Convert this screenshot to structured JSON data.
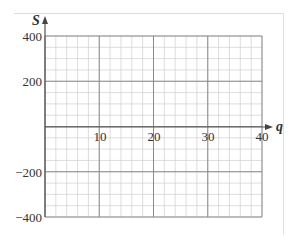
{
  "chart_data": {
    "type": "line",
    "title": "",
    "xlabel": "q",
    "ylabel": "S",
    "xlim": [
      0,
      40
    ],
    "ylim": [
      -400,
      400
    ],
    "x_ticks": [
      10,
      20,
      30,
      40
    ],
    "x_tick_labels": [
      "10",
      "20",
      "30",
      "40"
    ],
    "y_ticks": [
      400,
      200,
      -200,
      -400
    ],
    "y_tick_labels": [
      "400",
      "200",
      "−200",
      "−400"
    ],
    "grid": true,
    "major_grid": {
      "x_step": 10,
      "y_step": 200
    },
    "minor_grid": {
      "x_step": 2,
      "y_step": 50
    },
    "series": [],
    "legend": null
  },
  "labels": {
    "x_axis": "q",
    "y_axis": "S",
    "x10": "10",
    "x20": "20",
    "x30": "30",
    "x40": "40",
    "y400": "400",
    "y200": "200",
    "yn200": "−200",
    "yn400": "−400"
  },
  "colors": {
    "major_grid": "#8a8a8a",
    "minor_grid": "#cfcfcf",
    "axis": "#555555",
    "text": "#333333"
  }
}
